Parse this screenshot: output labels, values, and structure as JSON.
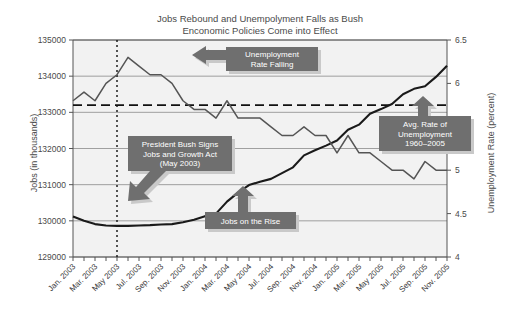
{
  "chart_data": {
    "type": "line",
    "title": "Jobs Rebound and Unempolyment Falls as Bush\nEnconomic Policies Come into Effect",
    "xlabel": "",
    "ylabel": "Jobs (in thousands)",
    "y2label": "Unemployment Rate (percent)",
    "ylim": [
      129000,
      135000
    ],
    "y2lim": [
      4,
      6.5
    ],
    "yticks": [
      129000,
      130000,
      131000,
      132000,
      133000,
      134000,
      135000
    ],
    "y2ticks": [
      4,
      4.5,
      5,
      5.5,
      6,
      6.5
    ],
    "ytick_labels": [
      "129000",
      "130000",
      "131000",
      "132000",
      "133000",
      "134000",
      "135000"
    ],
    "y2tick_labels": [
      "4",
      "4.5",
      "5",
      "5.5",
      "6",
      "6.5"
    ],
    "grid": true,
    "legend": "none",
    "x": [
      "Jan. 2003",
      "Feb. 2003",
      "Mar. 2003",
      "Apr. 2003",
      "May 2003",
      "Jun. 2003",
      "Jul. 2003",
      "Aug. 2003",
      "Sep. 2003",
      "Oct. 2003",
      "Nov. 2003",
      "Dec. 2003",
      "Jan. 2004",
      "Feb. 2004",
      "Mar. 2004",
      "Apr. 2004",
      "May 2004",
      "Jun. 2004",
      "Jul. 2004",
      "Aug. 2004",
      "Sep. 2004",
      "Oct. 2004",
      "Nov. 2004",
      "Dec. 2004",
      "Jan. 2005",
      "Feb. 2005",
      "Mar. 2005",
      "Apr. 2005",
      "May 2005",
      "Jun. 2005",
      "Jul. 2005",
      "Aug. 2005",
      "Sep. 2005",
      "Oct. 2005",
      "Nov. 2005"
    ],
    "xtick_labels": [
      "Jan. 2003",
      "Mar. 2003",
      "May 2003",
      "Jul. 2003",
      "Sep. 2003",
      "Nov. 2003",
      "Jan. 2004",
      "Mar. 2004",
      "May 2004",
      "Jul. 2004",
      "Sep. 2004",
      "Nov. 2004",
      "Jan. 2005",
      "Mar. 2005",
      "May 2005",
      "Jul. 2005",
      "Sep. 2005",
      "Nov. 2005"
    ],
    "series": [
      {
        "name": "Jobs (in thousands)",
        "axis": "left",
        "color": "#1a1a1a",
        "values": [
          130120,
          130000,
          129910,
          129870,
          129860,
          129860,
          129870,
          129880,
          129900,
          129910,
          129960,
          130030,
          130130,
          130200,
          130530,
          130780,
          130990,
          131080,
          131160,
          131320,
          131480,
          131810,
          131950,
          132080,
          132220,
          132520,
          132660,
          132960,
          133090,
          133230,
          133500,
          133650,
          133720,
          133980,
          134290
        ]
      },
      {
        "name": "Unemployment Rate (percent)",
        "axis": "right",
        "color": "#555555",
        "values": [
          5.8,
          5.9,
          5.8,
          6.0,
          6.1,
          6.3,
          6.2,
          6.1,
          6.1,
          6.0,
          5.8,
          5.7,
          5.7,
          5.6,
          5.8,
          5.6,
          5.6,
          5.6,
          5.5,
          5.4,
          5.4,
          5.5,
          5.4,
          5.4,
          5.2,
          5.4,
          5.2,
          5.2,
          5.1,
          5.0,
          5.0,
          4.9,
          5.1,
          5.0,
          5.0
        ]
      }
    ],
    "reference_lines": [
      {
        "name": "avg-unemployment-rate-line",
        "orientation": "horizontal",
        "axis": "right",
        "value": 5.75,
        "style": "dashed"
      },
      {
        "name": "jobs-and-growth-act-line",
        "orientation": "vertical",
        "value": "May 2003",
        "style": "dotted"
      }
    ],
    "annotations": [
      {
        "name": "unemployment-rate-falling",
        "text": "Unemployment\nRate Falling",
        "lines": [
          "Unemployment",
          "Rate Falling"
        ],
        "arrow": "left"
      },
      {
        "name": "president-bush-signs-jobs-and-growth-act",
        "text": "President Bush Signs\nJobs and Growth Act\n(May 2003)",
        "lines": [
          "President Bush Signs",
          "Jobs and Growth Act",
          "(May 2003)"
        ],
        "arrow": "down-left"
      },
      {
        "name": "jobs-on-the-rise",
        "text": "Jobs on the Rise",
        "lines": [
          "Jobs on the Rise"
        ],
        "arrow": "up"
      },
      {
        "name": "avg-rate-of-unemployment",
        "text": "Avg. Rate of\nUnemployment\n1960–2005",
        "lines": [
          "Avg. Rate of",
          "Unemployment",
          "1960–2005"
        ],
        "arrow": "up"
      }
    ],
    "colors": {
      "jobs_line": "#1a1a1a",
      "unemployment_line": "#555555",
      "callout_fill": "#6f6f6f",
      "callout_text": "#ffffff",
      "plot_background": "#f2f2f2",
      "grid": "#8a8a8a"
    }
  }
}
